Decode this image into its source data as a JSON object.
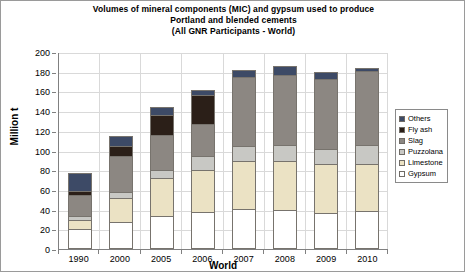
{
  "title": {
    "line1": "Volumes of mineral components (MIC) and gypsum used to produce",
    "line2": "Portland and blended cements",
    "line3": "(All GNR Participants - World)"
  },
  "axes": {
    "y_label": "Million t",
    "x_label": "World",
    "y_ticks": [
      "200",
      "180",
      "160",
      "140",
      "120",
      "100",
      "80",
      "60",
      "40",
      "20",
      "0"
    ]
  },
  "legend": {
    "items": [
      {
        "label": "Others",
        "color": "#3d4a66"
      },
      {
        "label": "Fly ash",
        "color": "#2b1f18"
      },
      {
        "label": "Slag",
        "color": "#8c8782"
      },
      {
        "label": "Puzzolana",
        "color": "#c8c8c4"
      },
      {
        "label": "Limestone",
        "color": "#ebe2c4"
      },
      {
        "label": "Gypsum",
        "color": "#ffffff"
      }
    ]
  },
  "chart_data": {
    "type": "bar",
    "title": "Volumes of mineral components (MIC) and gypsum used to produce Portland and blended cements (All GNR Participants - World)",
    "xlabel": "World",
    "ylabel": "Million t",
    "ylim": [
      0,
      200
    ],
    "ytick_step": 20,
    "grid": true,
    "stacked": true,
    "legend_position": "right",
    "categories": [
      "1990",
      "2000",
      "2005",
      "2006",
      "2007",
      "2008",
      "2009",
      "2010"
    ],
    "stack_order_bottom_to_top": [
      "Gypsum",
      "Limestone",
      "Puzzolana",
      "Slag",
      "Fly ash",
      "Others"
    ],
    "series": [
      {
        "name": "Gypsum",
        "color": "#ffffff",
        "values": [
          20,
          27,
          34,
          38,
          41,
          40,
          37,
          39
        ]
      },
      {
        "name": "Limestone",
        "color": "#ebe2c4",
        "values": [
          10,
          26,
          39,
          43,
          49,
          50,
          50,
          48
        ]
      },
      {
        "name": "Puzzolana",
        "color": "#c8c8c4",
        "values": [
          6,
          7,
          9,
          15,
          17,
          18,
          17,
          21
        ]
      },
      {
        "name": "Slag",
        "color": "#8c8782",
        "values": [
          22,
          37,
          37,
          34,
          71,
          72,
          72,
          76
        ]
      },
      {
        "name": "Fly ash",
        "color": "#2b1f18",
        "values": [
          5,
          12,
          21,
          30,
          0,
          0,
          0,
          0
        ]
      },
      {
        "name": "Others",
        "color": "#3d4a66",
        "values": [
          19,
          11,
          9,
          7,
          8,
          10,
          8,
          4
        ]
      }
    ],
    "totals": [
      82,
      120,
      149,
      167,
      186,
      190,
      184,
      188
    ]
  }
}
